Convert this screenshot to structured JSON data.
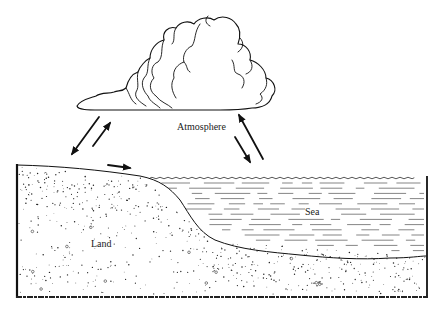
{
  "diagram": {
    "title": "",
    "labels": {
      "atmosphere": "Atmosphere",
      "land": "Land",
      "sea": "Sea"
    },
    "components": [
      {
        "id": "cloud",
        "type": "cumulus-cloud"
      },
      {
        "id": "land",
        "type": "stippled-ground"
      },
      {
        "id": "sea",
        "type": "water-body"
      }
    ],
    "arrows": [
      {
        "id": "atmosphere-to-land",
        "from": "atmosphere",
        "to": "land",
        "direction": "down-left"
      },
      {
        "id": "land-to-atmosphere",
        "from": "land",
        "to": "atmosphere",
        "direction": "up-right"
      },
      {
        "id": "land-to-sea",
        "from": "land",
        "to": "sea",
        "direction": "right"
      },
      {
        "id": "atmosphere-to-sea",
        "from": "atmosphere",
        "to": "sea",
        "direction": "down-right"
      },
      {
        "id": "sea-to-atmosphere",
        "from": "sea",
        "to": "atmosphere",
        "direction": "up-left"
      }
    ],
    "colors": {
      "ink": "#111111",
      "background": "#ffffff"
    }
  }
}
